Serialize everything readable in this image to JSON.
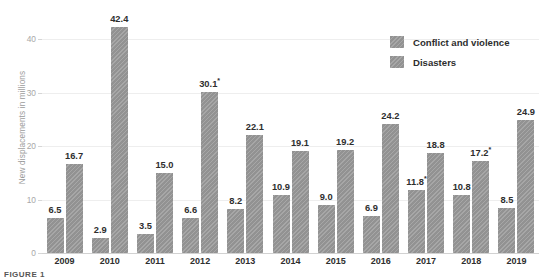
{
  "chart_data": {
    "type": "bar",
    "title": "",
    "subtitle": "",
    "xlabel": "",
    "ylabel": "New displacements in millions",
    "categories": [
      "2009",
      "2010",
      "2011",
      "2012",
      "2013",
      "2014",
      "2015",
      "2016",
      "2017",
      "2018",
      "2019"
    ],
    "ylim": [
      0,
      44
    ],
    "yticks": [
      0,
      10,
      20,
      30,
      40
    ],
    "ytick_labels": [
      "0",
      "10",
      "20",
      "30",
      "40"
    ],
    "grid": true,
    "legend_position": "top-right",
    "series": [
      {
        "name": "Conflict and violence",
        "color": "#9a9a9a",
        "values": [
          6.5,
          2.9,
          3.5,
          6.6,
          8.2,
          10.9,
          9.0,
          6.9,
          11.8,
          10.8,
          8.5
        ],
        "labels": [
          "6.5",
          "2.9",
          "3.5",
          "6.6",
          "8.2",
          "10.9",
          "9.0",
          "6.9",
          "11.8",
          "10.8",
          "8.5"
        ],
        "asterisk": [
          false,
          false,
          false,
          false,
          false,
          false,
          false,
          false,
          true,
          false,
          false
        ]
      },
      {
        "name": "Disasters",
        "color": "#9a9a9a",
        "values": [
          16.7,
          42.4,
          15.0,
          30.1,
          22.1,
          19.1,
          19.2,
          24.2,
          18.8,
          17.2,
          24.9
        ],
        "labels": [
          "16.7",
          "42.4",
          "15.0",
          "30.1",
          "22.1",
          "19.1",
          "19.2",
          "24.2",
          "18.8",
          "17.2",
          "24.9"
        ],
        "asterisk": [
          false,
          false,
          false,
          true,
          false,
          false,
          false,
          false,
          false,
          true,
          false
        ]
      }
    ]
  },
  "legend": {
    "items": [
      {
        "label": "Conflict and violence",
        "swatch": "#9a9a9a"
      },
      {
        "label": "Disasters",
        "swatch": "#9a9a9a"
      }
    ]
  },
  "footer": {
    "fragment": "FIGURE 1"
  }
}
